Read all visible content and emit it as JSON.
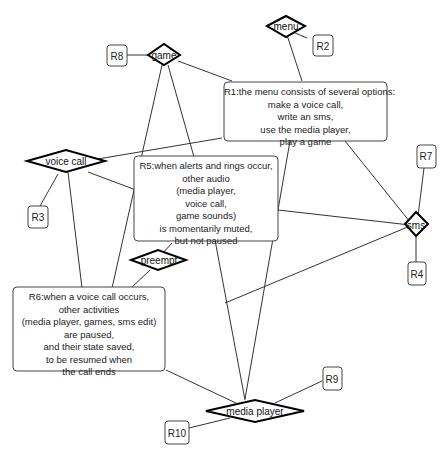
{
  "diagram": {
    "entities": {
      "menu": "menu",
      "game": "game",
      "voice_call": "voice call",
      "preempt": "preempt",
      "sms": "sms",
      "media_player": "media player"
    },
    "refs": {
      "r2": "R2",
      "r3": "R3",
      "r4": "R4",
      "r7": "R7",
      "r8": "R8",
      "r9": "R9",
      "r10": "R10"
    },
    "rules": {
      "r1": "R1:the menu consists of several options:\nmake a voice call,\nwrite an sms,\nuse the media player,\nplay a game",
      "r5": "R5:when alerts and rings occur,\nother audio\n(media player,\nvoice call,\ngame sounds)\nis momentarily muted,\nbut not paused",
      "r6": "R6:when a voice call occurs,\nother activities\n(media player, games, sms edit)\nare paused,\nand their state saved,\nto be resumed when\nthe call ends"
    },
    "colors": {
      "stroke": "#000000",
      "edge": "#333333",
      "background": "#ffffff"
    }
  }
}
